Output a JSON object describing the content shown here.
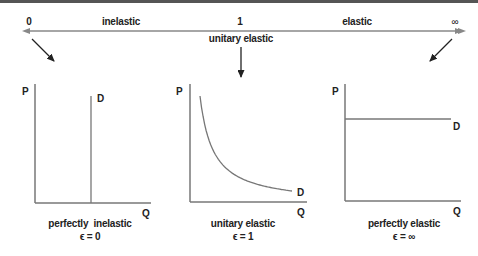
{
  "scale": {
    "left_end": "0",
    "left_region": "inelastic",
    "midpoint": "1",
    "midpoint_label": "unitary elastic",
    "right_region": "elastic",
    "right_end": "∞"
  },
  "panels": [
    {
      "id": "perfectly-inelastic",
      "y_axis": "P",
      "x_axis": "Q",
      "curve_label": "D",
      "caption": "perfectly  inelastic",
      "formula": "ϵ = 0",
      "curve_shape": "vertical"
    },
    {
      "id": "unitary-elastic",
      "y_axis": "P",
      "x_axis": "Q",
      "curve_label": "D",
      "caption": "unitary elastic",
      "formula": "ϵ = 1",
      "curve_shape": "rectangular-hyperbola"
    },
    {
      "id": "perfectly-elastic",
      "y_axis": "P",
      "x_axis": "Q",
      "curve_label": "D",
      "caption": "perfectly elastic",
      "formula": "ϵ = ∞",
      "curve_shape": "horizontal"
    }
  ],
  "colors": {
    "line": "#777777",
    "arrow": "#222222",
    "text": "#222222",
    "top_border": "#555555"
  }
}
